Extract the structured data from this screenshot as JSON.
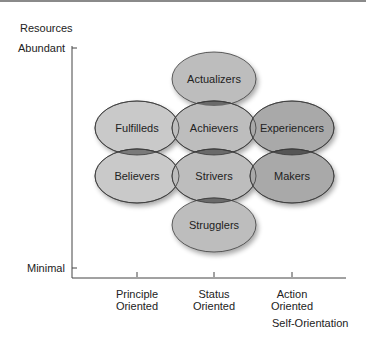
{
  "diagram": {
    "y_axis": {
      "title": "Resources",
      "top_label": "Abundant",
      "bottom_label": "Minimal"
    },
    "x_axis": {
      "title": "Self-Orientation",
      "ticks": [
        {
          "line1": "Principle",
          "line2": "Oriented"
        },
        {
          "line1": "Status",
          "line2": "Oriented"
        },
        {
          "line1": "Action",
          "line2": "Oriented"
        }
      ]
    },
    "segments": [
      {
        "name": "Actualizers",
        "column": "Status",
        "row": 0,
        "fill": "#bdbdbd"
      },
      {
        "name": "Fulfilleds",
        "column": "Principle",
        "row": 1,
        "fill": "#c9c9c9"
      },
      {
        "name": "Achievers",
        "column": "Status",
        "row": 1,
        "fill": "#bdbdbd"
      },
      {
        "name": "Experiencers",
        "column": "Action",
        "row": 1,
        "fill": "#a9a9a9"
      },
      {
        "name": "Believers",
        "column": "Principle",
        "row": 2,
        "fill": "#c9c9c9"
      },
      {
        "name": "Strivers",
        "column": "Status",
        "row": 2,
        "fill": "#bdbdbd"
      },
      {
        "name": "Makers",
        "column": "Action",
        "row": 2,
        "fill": "#a9a9a9"
      },
      {
        "name": "Strugglers",
        "column": "Status",
        "row": 3,
        "fill": "#bdbdbd"
      }
    ],
    "colors": {
      "outline": "#3a3a3a",
      "overlap": "#6a6a6a",
      "axis": "#444444"
    }
  }
}
